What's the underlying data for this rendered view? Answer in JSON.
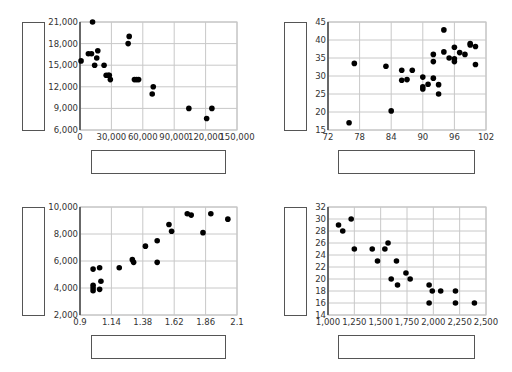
{
  "chart_data": [
    {
      "type": "scatter",
      "title": "",
      "xlabel": "",
      "ylabel": "",
      "xlim": [
        0,
        150000
      ],
      "ylim": [
        6000,
        21000
      ],
      "xticks": [
        0,
        30000,
        60000,
        90000,
        120000,
        150000
      ],
      "yticks": [
        6000,
        9000,
        12000,
        15000,
        18000,
        21000
      ],
      "xtick_labels": [
        "0",
        "30,000",
        "60,000",
        "90,000",
        "120,000",
        "150,000"
      ],
      "ytick_labels": [
        "6,000",
        "9,000",
        "12,000",
        "15,000",
        "18,000",
        "21,000"
      ],
      "grid": true,
      "points": [
        [
          1000,
          15600
        ],
        [
          12000,
          21000
        ],
        [
          8000,
          16600
        ],
        [
          11000,
          16600
        ],
        [
          14000,
          15000
        ],
        [
          16000,
          16000
        ],
        [
          17000,
          17000
        ],
        [
          23000,
          15000
        ],
        [
          25000,
          13600
        ],
        [
          27000,
          13600
        ],
        [
          28000,
          13600
        ],
        [
          29000,
          13000
        ],
        [
          46000,
          18000
        ],
        [
          47000,
          19000
        ],
        [
          52000,
          13000
        ],
        [
          54000,
          13000
        ],
        [
          56000,
          13000
        ],
        [
          69000,
          11000
        ],
        [
          70000,
          12000
        ],
        [
          104000,
          9000
        ],
        [
          121000,
          7600
        ],
        [
          126000,
          9000
        ]
      ]
    },
    {
      "type": "scatter",
      "title": "",
      "xlabel": "",
      "ylabel": "",
      "xlim": [
        72,
        102
      ],
      "ylim": [
        15,
        45
      ],
      "xticks": [
        72,
        78,
        84,
        90,
        96,
        102
      ],
      "yticks": [
        15,
        20,
        25,
        30,
        35,
        40,
        45
      ],
      "xtick_labels": [
        "72",
        "78",
        "84",
        "90",
        "96",
        "102"
      ],
      "ytick_labels": [
        "15",
        "20",
        "25",
        "30",
        "35",
        "40",
        "45"
      ],
      "grid": true,
      "points": [
        [
          76,
          17
        ],
        [
          77,
          33.5
        ],
        [
          83,
          32.7
        ],
        [
          84,
          20.3
        ],
        [
          86,
          31.6
        ],
        [
          86,
          28.8
        ],
        [
          87,
          29
        ],
        [
          88,
          31.6
        ],
        [
          90,
          29.7
        ],
        [
          90,
          27
        ],
        [
          90,
          26.4
        ],
        [
          91,
          27.7
        ],
        [
          92,
          29.4
        ],
        [
          92,
          36
        ],
        [
          92,
          34
        ],
        [
          93,
          27.6
        ],
        [
          93,
          25
        ],
        [
          94,
          42.8
        ],
        [
          94,
          36.7
        ],
        [
          95,
          35
        ],
        [
          96,
          38
        ],
        [
          96,
          34.8
        ],
        [
          96,
          34
        ],
        [
          97,
          36.5
        ],
        [
          98,
          36
        ],
        [
          99,
          38.6
        ],
        [
          99,
          39
        ],
        [
          100,
          38.2
        ],
        [
          100,
          33.2
        ]
      ]
    },
    {
      "type": "scatter",
      "title": "",
      "xlabel": "",
      "ylabel": "",
      "xlim": [
        0.9,
        2.1
      ],
      "ylim": [
        2000,
        10000
      ],
      "xticks": [
        0.9,
        1.14,
        1.38,
        1.62,
        1.86,
        2.1
      ],
      "yticks": [
        2000,
        4000,
        6000,
        8000,
        10000
      ],
      "xtick_labels": [
        "0.9",
        "1.14",
        "1.38",
        "1.62",
        "1.86",
        "2.1"
      ],
      "ytick_labels": [
        "2,000",
        "4,000",
        "6,000",
        "8,000",
        "10,000"
      ],
      "grid": true,
      "points": [
        [
          1.0,
          5400
        ],
        [
          1.0,
          4200
        ],
        [
          1.0,
          4000
        ],
        [
          1.0,
          3800
        ],
        [
          1.05,
          5500
        ],
        [
          1.05,
          3900
        ],
        [
          1.06,
          4500
        ],
        [
          1.2,
          5500
        ],
        [
          1.3,
          6100
        ],
        [
          1.31,
          5900
        ],
        [
          1.4,
          7100
        ],
        [
          1.49,
          7500
        ],
        [
          1.49,
          5900
        ],
        [
          1.58,
          8700
        ],
        [
          1.6,
          8200
        ],
        [
          1.72,
          9500
        ],
        [
          1.75,
          9400
        ],
        [
          1.84,
          8100
        ],
        [
          1.9,
          9500
        ],
        [
          2.03,
          9100
        ]
      ]
    },
    {
      "type": "scatter",
      "title": "",
      "xlabel": "",
      "ylabel": "",
      "xlim": [
        1000,
        2500
      ],
      "ylim": [
        14,
        32
      ],
      "xticks": [
        1000,
        1250,
        1500,
        1750,
        2000,
        2250,
        2500
      ],
      "yticks": [
        14,
        16,
        18,
        20,
        22,
        24,
        26,
        28,
        30,
        32
      ],
      "xtick_labels": [
        "1,000",
        "1,250",
        "1,500",
        "1,750",
        "2,000",
        "2,250",
        "2,500"
      ],
      "ytick_labels": [
        "14",
        "16",
        "18",
        "20",
        "22",
        "24",
        "26",
        "28",
        "30",
        "32"
      ],
      "grid": true,
      "points": [
        [
          1100,
          29
        ],
        [
          1140,
          28
        ],
        [
          1220,
          30
        ],
        [
          1250,
          25
        ],
        [
          1420,
          25
        ],
        [
          1470,
          23
        ],
        [
          1540,
          25
        ],
        [
          1570,
          26
        ],
        [
          1600,
          20
        ],
        [
          1650,
          23
        ],
        [
          1660,
          19
        ],
        [
          1740,
          21
        ],
        [
          1780,
          20
        ],
        [
          1960,
          19
        ],
        [
          1960,
          16
        ],
        [
          1990,
          18
        ],
        [
          2070,
          18
        ],
        [
          2210,
          18
        ],
        [
          2210,
          16
        ],
        [
          2390,
          16
        ]
      ]
    }
  ]
}
